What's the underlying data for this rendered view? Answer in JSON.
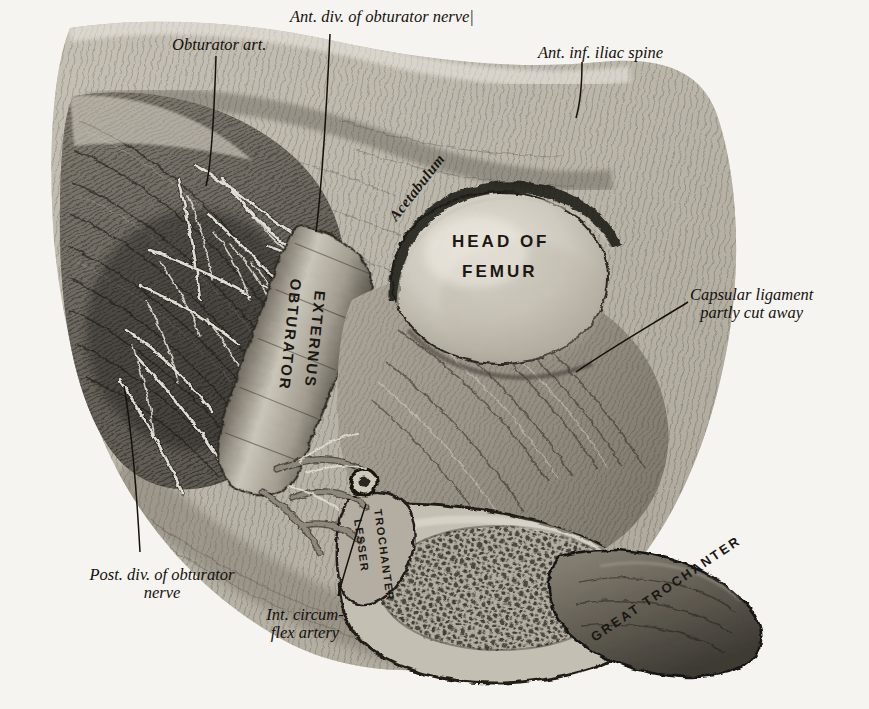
{
  "figure": {
    "domain": "anatomical-engraving",
    "background_color": "#f6f4f0",
    "ink_color": "#14110d"
  },
  "callout_labels": [
    {
      "id": "obturator-art",
      "text": "Obturator art.",
      "lines": [
        "Obturator art."
      ],
      "x": 172,
      "y": 36,
      "align": "left"
    },
    {
      "id": "ant-div-obt-nerve",
      "text": "Ant. div. of obturator nerve|",
      "lines": [
        "Ant. div. of obturator nerve|"
      ],
      "x": 290,
      "y": 8,
      "align": "left"
    },
    {
      "id": "ant-inf-iliac-spine",
      "text": "Ant. inf. iliac spine",
      "lines": [
        "Ant. inf. iliac spine"
      ],
      "x": 538,
      "y": 44,
      "align": "left"
    },
    {
      "id": "capsular-ligament",
      "text": "Capsular ligament partly cut away",
      "lines": [
        "Capsular ligament",
        "partly cut away"
      ],
      "x": 690,
      "y": 286,
      "align": "left"
    },
    {
      "id": "post-div-obt-nerve",
      "text": "Post. div. of obturator nerve",
      "lines": [
        "Post. div. of obturator",
        "nerve"
      ],
      "x": 140,
      "y": 566,
      "align": "center"
    },
    {
      "id": "int-circumflex-art",
      "text": "Int. circumflex artery",
      "lines": [
        "Int. circum-",
        "flex artery"
      ],
      "x": 302,
      "y": 606,
      "align": "center"
    }
  ],
  "plate_labels": [
    {
      "id": "acetabulum",
      "text": "Acetabulum",
      "style": "curved-italic"
    },
    {
      "id": "head-of-femur",
      "text": "HEAD OF",
      "text2": "FEMUR",
      "style": "spaced-caps"
    },
    {
      "id": "obturator-externus",
      "text": "OBTURATOR",
      "text2": "EXTERNUS",
      "style": "vertical-caps"
    },
    {
      "id": "lesser-trochanter",
      "text": "LESSER",
      "text2": "TROCHANTER",
      "style": "rotated-small-caps"
    },
    {
      "id": "great-trochanter",
      "text": "GREAT TROCHANTER",
      "style": "curved-caps"
    }
  ],
  "ghost_text": [
    {
      "text": "the popliteal space",
      "x": 640,
      "y": 2
    },
    {
      "text": "rior tibial artery",
      "x": 708,
      "y": 28
    },
    {
      "text": "Tibia.",
      "x": 706,
      "y": 76
    },
    {
      "text": "ed with the external",
      "x": 682,
      "y": 100
    },
    {
      "text": "and the anterior",
      "x": 694,
      "y": 124
    },
    {
      "text": "Fibula.",
      "x": 700,
      "y": 150
    },
    {
      "text": "branches",
      "x": 712,
      "y": 176
    },
    {
      "text": "Foot.",
      "x": 704,
      "y": 200
    },
    {
      "text": "Ankle",
      "x": 740,
      "y": 224
    },
    {
      "text": "of the",
      "x": 10,
      "y": 108
    },
    {
      "text": "tendon",
      "x": 4,
      "y": 188
    },
    {
      "text": "in front",
      "x": 2,
      "y": 318
    },
    {
      "text": "of the bone",
      "x": 0,
      "y": 344
    },
    {
      "text": "and the",
      "x": 4,
      "y": 370
    },
    {
      "text": "external",
      "x": 2,
      "y": 396
    },
    {
      "text": "is found",
      "x": 6,
      "y": 422
    },
    {
      "text": "the inner",
      "x": 2,
      "y": 448
    },
    {
      "text": "above",
      "x": 8,
      "y": 474
    },
    {
      "text": "between the",
      "x": 0,
      "y": 500
    },
    {
      "text": "surface of",
      "x": 2,
      "y": 530
    },
    {
      "text": "nearly",
      "x": 8,
      "y": 556
    },
    {
      "text": "Obturator",
      "x": 62,
      "y": 602
    },
    {
      "text": "the femoral vessels",
      "x": 30,
      "y": 626
    },
    {
      "text": "In the upper part of the thigh",
      "x": 30,
      "y": 668
    },
    {
      "text": "the vessels are covered by",
      "x": 36,
      "y": 690
    },
    {
      "text": "tissue in",
      "x": 620,
      "y": 648
    },
    {
      "text": "connective",
      "x": 600,
      "y": 672
    }
  ]
}
